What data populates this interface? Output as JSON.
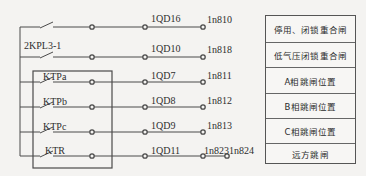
{
  "diagram": {
    "type": "relay-contact-wiring",
    "rows": [
      {
        "y": 27,
        "contact_label": "",
        "terminal_block": "1QD16",
        "terminal_out": "1n810",
        "extra_terminal": "",
        "function": "停用、闭锁重合闸"
      },
      {
        "y": 57,
        "contact_label": "2KPL3-1",
        "terminal_block": "1QD10",
        "terminal_out": "1n818",
        "extra_terminal": "",
        "function": "低气压闭锁重合闸"
      },
      {
        "y": 82,
        "contact_label": "KTPa",
        "terminal_block": "1QD7",
        "terminal_out": "1n811",
        "extra_terminal": "",
        "function": "A相跳闸位置"
      },
      {
        "y": 107,
        "contact_label": "KTPb",
        "terminal_block": "1QD8",
        "terminal_out": "1n812",
        "extra_terminal": "",
        "function": "B相跳闸位置"
      },
      {
        "y": 132,
        "contact_label": "KTPc",
        "terminal_block": "1QD9",
        "terminal_out": "1n813",
        "extra_terminal": "",
        "function": "C相跳闸位置"
      },
      {
        "y": 156,
        "contact_label": "KTR",
        "terminal_block": "1QD11",
        "terminal_out": "1n823",
        "extra_terminal": "1n824",
        "function": "远方跳闸"
      }
    ],
    "enclosure": {
      "label": "",
      "contains": [
        "KTPa",
        "KTPb",
        "KTPc",
        "KTR"
      ]
    },
    "colors": {
      "line": "#4a4a4a",
      "text": "#2e2e2e",
      "background": "#f4f3f1"
    }
  }
}
